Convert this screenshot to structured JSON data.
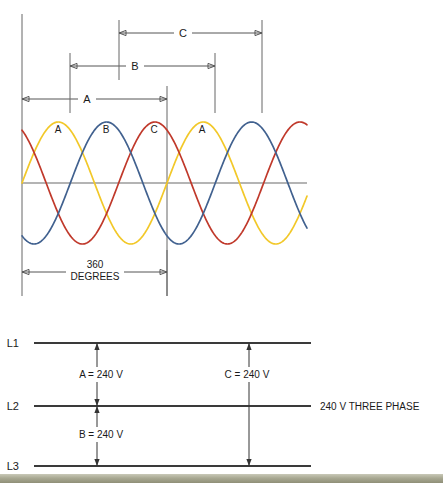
{
  "figure": {
    "background_color": "#ffffff"
  },
  "waveform_section": {
    "axis": {
      "zero_line_label": "",
      "left_axis_x": 22,
      "zero_y": 183,
      "amplitude_px": 61,
      "plot_right_x": 307
    },
    "period_label": {
      "line1": "360",
      "line2": "DEGREES"
    },
    "inline_labels": [
      {
        "text": "A",
        "x": 58,
        "y": 133
      },
      {
        "text": "B",
        "x": 106,
        "y": 133
      },
      {
        "text": "C",
        "x": 154,
        "y": 133
      },
      {
        "text": "A",
        "x": 202,
        "y": 133
      }
    ],
    "dimensions": [
      {
        "label": "A",
        "start_x": 22,
        "end_x": 167,
        "y": 99,
        "ext_top_y": 86,
        "ext_bottom_y": 113,
        "span_degrees": 360
      },
      {
        "label": "B",
        "start_x": 70,
        "end_x": 215,
        "y": 66,
        "ext_top_y": 53,
        "ext_bottom_y": 113,
        "span_degrees": 360
      },
      {
        "label": "C",
        "start_x": 119,
        "end_x": 262,
        "y": 33,
        "ext_top_y": 20,
        "ext_bottom_y": 113,
        "span_degrees": 360
      }
    ]
  },
  "chart_data": {
    "type": "line",
    "xlabel": "360 DEGREES",
    "ylabel": "",
    "x_unit": "degrees",
    "x": [
      0,
      360
    ],
    "xlim": [
      0,
      715
    ],
    "ylim": [
      -1,
      1
    ],
    "grid": false,
    "legend": "inline",
    "period_degrees": 360,
    "phase_offset_degrees": 120,
    "series": [
      {
        "name": "A",
        "color": "#f2c829",
        "phase_degrees": 0,
        "amplitude": 1,
        "peak_label": "A"
      },
      {
        "name": "B",
        "color": "#c0392b",
        "phase_degrees": 120,
        "amplitude": 1,
        "peak_label": "B"
      },
      {
        "name": "C",
        "color": "#41618f",
        "phase_degrees": 240,
        "amplitude": 1,
        "peak_label": "C"
      }
    ]
  },
  "line_diagram": {
    "system_label": "240 V THREE PHASE",
    "buses": [
      {
        "label": "L1",
        "y": 343
      },
      {
        "label": "L2",
        "y": 406
      },
      {
        "label": "L3",
        "y": 466
      }
    ],
    "measurements": [
      {
        "label": "A = 240 V",
        "from_bus": "L1",
        "to_bus": "L2",
        "x": 97,
        "text_x": 78,
        "text_y": 377
      },
      {
        "label": "B = 240 V",
        "from_bus": "L2",
        "to_bus": "L3",
        "x": 97,
        "text_x": 78,
        "text_y": 437
      },
      {
        "label": "C = 240 V",
        "from_bus": "L1",
        "to_bus": "L3",
        "x": 249,
        "text_x": 221,
        "text_y": 377
      }
    ]
  },
  "colors": {
    "phase_a": "#f2c829",
    "phase_b": "#c0392b",
    "phase_c": "#41618f",
    "axis": "#6b6b6b",
    "bus": "#3a3a3a",
    "dimension": "#555555",
    "text": "#1a1a1a",
    "scan_strip": "#a9a993"
  },
  "scan_artifact": {
    "present": true,
    "top_y": 474,
    "height": 9
  }
}
